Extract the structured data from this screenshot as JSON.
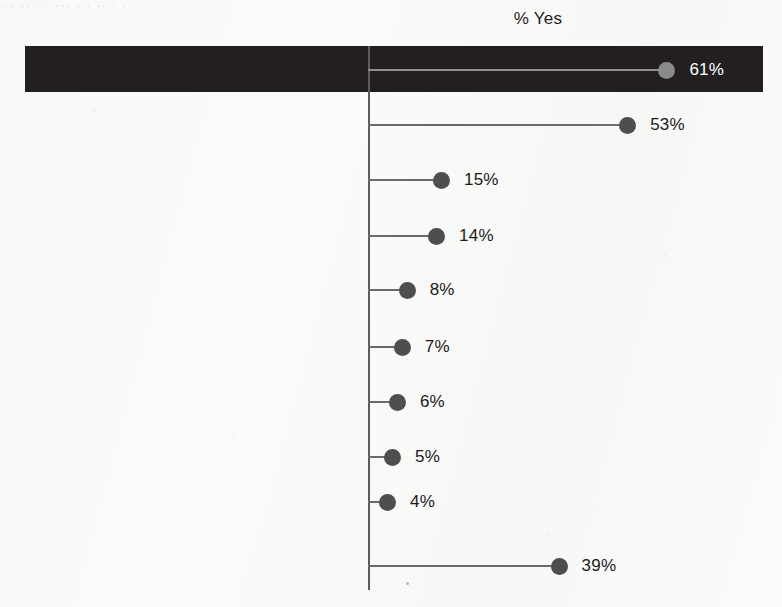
{
  "top_bleed_text": "· ·   ·· ·          ·   ···          ·        ·      ·· ·          ·",
  "chart_data": {
    "type": "bar",
    "orientation": "horizontal",
    "subtype": "lollipop",
    "title": "",
    "axis_title": "% Yes",
    "xlabel": "",
    "ylabel": "",
    "xlim": [
      0,
      70
    ],
    "grid": false,
    "legend": false,
    "value_suffix": "%",
    "categories": [
      "Any of these",
      "Go in late, leave early, take time off",
      "Went from working full to\npart-time/reduce work hours",
      "Leave of absense",
      "Receive warning about\nperformance/attendance",
      "Turn down promotion",
      "Give up working entirely",
      "Retired early",
      "Lose job benefits",
      "None of these"
    ],
    "values": [
      61,
      53,
      15,
      14,
      8,
      7,
      6,
      5,
      4,
      39
    ],
    "value_labels": [
      "61%",
      "53%",
      "15%",
      "14%",
      "8%",
      "7%",
      "6%",
      "5%",
      "4%",
      "39%"
    ],
    "highlighted_index": 0,
    "colors": {
      "dot": "#4e4e4e",
      "stem": "#6b6b6b",
      "highlight_band": "#231f20",
      "highlight_dot": "#8a8a8a",
      "highlight_stem": "#8f8f8f",
      "highlight_text": "#ffffff",
      "text": "#1a1a1a",
      "axis": "#5c5c5c",
      "background": "#fbfbf9"
    }
  },
  "layout": {
    "axis_x": 368,
    "px_per_percent": 4.9,
    "label_right": 358,
    "value_gap": 14,
    "row_y": [
      70,
      125,
      180,
      236,
      290,
      347,
      402,
      457,
      502,
      566
    ]
  }
}
